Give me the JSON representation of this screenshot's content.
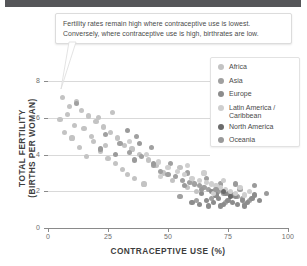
{
  "top_bar": {
    "color": "#555659"
  },
  "callout": {
    "line1": "Fertility rates remain high where contraceptive use is lowest.",
    "line2": "Conversely, where contraceptive use is high, birthrates are low."
  },
  "legend": {
    "items": [
      {
        "label": "Africa",
        "color": "#c3c3c3"
      },
      {
        "label": "Asia",
        "color": "#a0a0a0"
      },
      {
        "label": "Europe",
        "color": "#8c8c8c"
      },
      {
        "label": "Latin America /\nCaribbean",
        "color": "#cfcfcf"
      },
      {
        "label": "North America",
        "color": "#6b6b6b"
      },
      {
        "label": "Oceania",
        "color": "#9a9a9a"
      }
    ]
  },
  "chart_data": {
    "type": "scatter",
    "title": "",
    "xlabel": "CONTRACEPTIVE USE (%)",
    "ylabel": "TOTAL FERTILITY\n(BIRTHS PER WOMAN)",
    "xlim": [
      0,
      100
    ],
    "ylim": [
      0,
      8.8
    ],
    "xticks": [
      0,
      25,
      50,
      75,
      100
    ],
    "yticks": [
      0,
      2,
      4,
      6,
      8
    ],
    "grid": "horizontal",
    "legend_position": "right",
    "annotation": "Fertility rates remain high where contraceptive use is lowest. Conversely, where contraceptive use is high, birthrates are low.",
    "series": [
      {
        "name": "Africa",
        "color": "#c3c3c3",
        "points": [
          [
            6,
            7.1
          ],
          [
            9,
            6.6
          ],
          [
            12,
            6.9
          ],
          [
            8,
            6.2
          ],
          [
            14,
            6.4
          ],
          [
            5,
            5.9
          ],
          [
            17,
            6.1
          ],
          [
            11,
            5.6
          ],
          [
            20,
            5.8
          ],
          [
            7,
            5.2
          ],
          [
            15,
            5.4
          ],
          [
            23,
            5.5
          ],
          [
            10,
            4.9
          ],
          [
            26,
            5.2
          ],
          [
            19,
            4.7
          ],
          [
            13,
            4.4
          ],
          [
            29,
            4.9
          ],
          [
            22,
            4.2
          ],
          [
            32,
            4.5
          ],
          [
            16,
            3.9
          ],
          [
            35,
            4.3
          ],
          [
            25,
            3.8
          ],
          [
            38,
            4.0
          ],
          [
            28,
            3.5
          ],
          [
            42,
            3.7
          ],
          [
            31,
            3.2
          ],
          [
            45,
            3.4
          ],
          [
            21,
            6.0
          ],
          [
            18,
            5.0
          ],
          [
            24,
            4.5
          ],
          [
            33,
            2.9
          ],
          [
            48,
            3.0
          ],
          [
            36,
            2.7
          ],
          [
            52,
            2.6
          ],
          [
            40,
            2.4
          ],
          [
            58,
            2.2
          ],
          [
            55,
            3.3
          ],
          [
            60,
            2.5
          ],
          [
            62,
            2.0
          ],
          [
            27,
            6.3
          ]
        ]
      },
      {
        "name": "Asia",
        "color": "#a0a0a0",
        "points": [
          [
            12,
            6.8
          ],
          [
            24,
            5.1
          ],
          [
            30,
            4.6
          ],
          [
            34,
            4.1
          ],
          [
            39,
            3.9
          ],
          [
            44,
            3.4
          ],
          [
            47,
            3.1
          ],
          [
            50,
            2.9
          ],
          [
            53,
            2.8
          ],
          [
            56,
            2.6
          ],
          [
            59,
            2.5
          ],
          [
            61,
            2.4
          ],
          [
            63,
            2.3
          ],
          [
            65,
            2.2
          ],
          [
            67,
            2.1
          ],
          [
            69,
            2.0
          ],
          [
            71,
            2.0
          ],
          [
            73,
            1.9
          ],
          [
            75,
            1.9
          ],
          [
            77,
            1.8
          ],
          [
            79,
            1.7
          ],
          [
            81,
            1.6
          ],
          [
            80,
            2.1
          ],
          [
            72,
            2.4
          ],
          [
            66,
            2.7
          ],
          [
            58,
            3.0
          ],
          [
            51,
            3.5
          ],
          [
            43,
            4.4
          ],
          [
            37,
            5.0
          ],
          [
            55,
            1.7
          ],
          [
            62,
            1.5
          ],
          [
            74,
            1.4
          ],
          [
            84,
            1.5
          ],
          [
            82,
            1.3
          ],
          [
            68,
            1.6
          ]
        ]
      },
      {
        "name": "Europe",
        "color": "#8c8c8c",
        "points": [
          [
            60,
            1.4
          ],
          [
            63,
            1.3
          ],
          [
            66,
            1.5
          ],
          [
            69,
            1.4
          ],
          [
            71,
            1.6
          ],
          [
            73,
            1.3
          ],
          [
            75,
            1.5
          ],
          [
            77,
            1.4
          ],
          [
            79,
            1.3
          ],
          [
            81,
            1.5
          ],
          [
            83,
            1.4
          ],
          [
            85,
            1.6
          ],
          [
            70,
            1.8
          ],
          [
            74,
            1.9
          ],
          [
            78,
            1.7
          ],
          [
            67,
            1.2
          ],
          [
            72,
            1.2
          ],
          [
            76,
            1.9
          ],
          [
            68,
            2.0
          ],
          [
            86,
            1.8
          ],
          [
            88,
            1.5
          ],
          [
            64,
            1.9
          ],
          [
            82,
            1.2
          ]
        ]
      },
      {
        "name": "Latin America / Caribbean",
        "color": "#cfcfcf",
        "points": [
          [
            34,
            4.7
          ],
          [
            41,
            4.0
          ],
          [
            46,
            3.6
          ],
          [
            50,
            3.3
          ],
          [
            54,
            3.1
          ],
          [
            57,
            2.9
          ],
          [
            60,
            2.7
          ],
          [
            63,
            2.6
          ],
          [
            66,
            2.5
          ],
          [
            68,
            2.4
          ],
          [
            70,
            2.3
          ],
          [
            72,
            2.2
          ],
          [
            74,
            2.1
          ],
          [
            76,
            2.0
          ],
          [
            78,
            1.9
          ],
          [
            80,
            2.2
          ],
          [
            73,
            2.6
          ],
          [
            65,
            3.0
          ],
          [
            58,
            3.4
          ],
          [
            47,
            2.8
          ],
          [
            82,
            1.8
          ],
          [
            84,
            2.0
          ],
          [
            69,
            1.9
          ]
        ]
      },
      {
        "name": "North America",
        "color": "#6b6b6b",
        "points": [
          [
            73,
            2.0
          ],
          [
            76,
            1.7
          ]
        ]
      },
      {
        "name": "Oceania",
        "color": "#9a9a9a",
        "points": [
          [
            22,
            4.3
          ],
          [
            28,
            4.0
          ],
          [
            36,
            3.7
          ],
          [
            44,
            3.5
          ],
          [
            57,
            2.3
          ],
          [
            64,
            2.1
          ],
          [
            70,
            2.1
          ],
          [
            78,
            2.4
          ],
          [
            86,
            2.3
          ],
          [
            91,
            1.9
          ],
          [
            33,
            5.3
          ],
          [
            38,
            4.6
          ]
        ]
      }
    ]
  }
}
